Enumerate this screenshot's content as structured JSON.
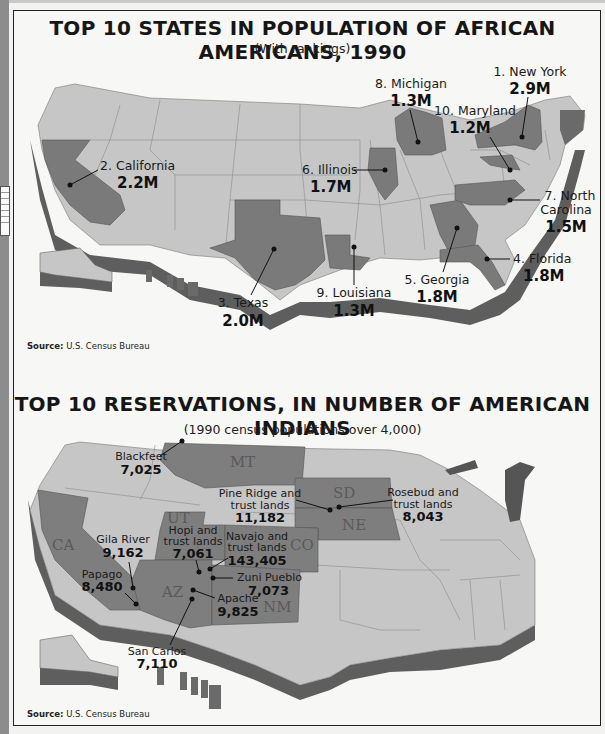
{
  "map1": {
    "title": "TOP 10 STATES IN POPULATION OF AFRICAN AMERICANS, 1990",
    "subtitle": "(With rankings)",
    "source_label": "Source:",
    "source_text": "U.S. Census Bureau",
    "highlight_color": "#7a7a7a",
    "base_color": "#c4c4c4",
    "states": [
      {
        "rank": 1,
        "label": "1. New York",
        "value": "2.9M",
        "population_millions": 2.9
      },
      {
        "rank": 2,
        "label": "2. California",
        "value": "2.2M",
        "population_millions": 2.2
      },
      {
        "rank": 3,
        "label": "3. Texas",
        "value": "2.0M",
        "population_millions": 2.0
      },
      {
        "rank": 4,
        "label": "4. Florida",
        "value": "1.8M",
        "population_millions": 1.8
      },
      {
        "rank": 5,
        "label": "5. Georgia",
        "value": "1.8M",
        "population_millions": 1.8
      },
      {
        "rank": 6,
        "label": "6. Illinois",
        "value": "1.7M",
        "population_millions": 1.7
      },
      {
        "rank": 7,
        "label_line1": "7. North",
        "label_line2": "Carolina",
        "value": "1.5M",
        "population_millions": 1.5
      },
      {
        "rank": 8,
        "label": "8. Michigan",
        "value": "1.3M",
        "population_millions": 1.3
      },
      {
        "rank": 9,
        "label": "9. Louisiana",
        "value": "1.3M",
        "population_millions": 1.3
      },
      {
        "rank": 10,
        "label": "10. Maryland",
        "value": "1.2M",
        "population_millions": 1.2
      }
    ]
  },
  "map2": {
    "title": "TOP 10 RESERVATIONS, IN NUMBER OF AMERICAN INDIANS",
    "subtitle": "(1990 census populations over 4,000)",
    "source_label": "Source:",
    "source_text": "U.S. Census Bureau",
    "state_abbreviations": [
      "MT",
      "SD",
      "NE",
      "UT",
      "CO",
      "CA",
      "AZ",
      "NM"
    ],
    "reservations": [
      {
        "name": "Blackfeet",
        "value": "7,025",
        "population": 7025
      },
      {
        "name_line1": "Pine Ridge and",
        "name_line2": "trust lands",
        "value": "11,182",
        "population": 11182
      },
      {
        "name_line1": "Rosebud and",
        "name_line2": "trust lands",
        "value": "8,043",
        "population": 8043
      },
      {
        "name": "Gila River",
        "value": "9,162",
        "population": 9162
      },
      {
        "name_line1": "Hopi and",
        "name_line2": "trust lands",
        "value": "7,061",
        "population": 7061
      },
      {
        "name_line1": "Navajo and",
        "name_line2": "trust lands",
        "value": "143,405",
        "population": 143405
      },
      {
        "name": "Zuni Pueblo",
        "value": "7,073",
        "population": 7073
      },
      {
        "name": "Papago",
        "value": "8,480",
        "population": 8480
      },
      {
        "name": "Apache",
        "value": "9,825",
        "population": 9825
      },
      {
        "name": "San Carlos",
        "value": "7,110",
        "population": 7110
      }
    ]
  }
}
